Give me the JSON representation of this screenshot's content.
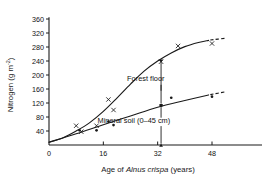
{
  "chart_data": {
    "type": "line",
    "title": "",
    "xlabel": "Age of Alnus crispa (years)",
    "xlabel_parts": {
      "prefix": "Age of ",
      "italic": "Alnus crispa",
      "suffix": " (years)"
    },
    "ylabel": "Nitrogen (g m-2)",
    "ylabel_parts": {
      "main": "Nitrogen (g  m",
      "superscript": "-2",
      "tail": ")"
    },
    "xlim": [
      0,
      52
    ],
    "ylim": [
      0,
      370
    ],
    "xticks": [
      0,
      16,
      32,
      48
    ],
    "xtick_labels": [
      "0",
      "16",
      "32",
      "48"
    ],
    "yticks": [
      40,
      80,
      120,
      160,
      200,
      240,
      280,
      320,
      360
    ],
    "ytick_labels": [
      "40",
      "80",
      "120",
      "160",
      "200",
      "240",
      "280",
      "320",
      "360"
    ],
    "grid": false,
    "legend": "none",
    "series": [
      {
        "name": "Forest floor",
        "marker": "x",
        "label": "Forest floor",
        "points": [
          {
            "x": 8.0,
            "y": 55
          },
          {
            "x": 9.5,
            "y": 38
          },
          {
            "x": 14.0,
            "y": 55
          },
          {
            "x": 17.5,
            "y": 130
          },
          {
            "x": 19.0,
            "y": 100
          },
          {
            "x": 33.0,
            "y": 238
          },
          {
            "x": 38.0,
            "y": 283
          },
          {
            "x": 48.0,
            "y": 290
          }
        ],
        "fit_curve": [
          {
            "x": 0,
            "y": 8
          },
          {
            "x": 4,
            "y": 20
          },
          {
            "x": 8,
            "y": 40
          },
          {
            "x": 12,
            "y": 64
          },
          {
            "x": 16,
            "y": 96
          },
          {
            "x": 20,
            "y": 134
          },
          {
            "x": 24,
            "y": 174
          },
          {
            "x": 28,
            "y": 211
          },
          {
            "x": 32,
            "y": 240
          },
          {
            "x": 36,
            "y": 263
          },
          {
            "x": 40,
            "y": 281
          },
          {
            "x": 44,
            "y": 293
          },
          {
            "x": 47,
            "y": 299
          }
        ],
        "dashed_extension": [
          {
            "x": 47.5,
            "y": 300
          },
          {
            "x": 52,
            "y": 305
          }
        ]
      },
      {
        "name": "Mineral soil (0-45 cm)",
        "marker": "dot",
        "label": "Mineral soil (0–45 cm)",
        "points": [
          {
            "x": 9.0,
            "y": 42
          },
          {
            "x": 14.0,
            "y": 42
          },
          {
            "x": 17.5,
            "y": 67
          },
          {
            "x": 19.0,
            "y": 57
          },
          {
            "x": 33.0,
            "y": 113
          },
          {
            "x": 36.0,
            "y": 135
          },
          {
            "x": 48.0,
            "y": 138
          }
        ],
        "fit_curve": [
          {
            "x": 0,
            "y": 8
          },
          {
            "x": 8,
            "y": 32
          },
          {
            "x": 16,
            "y": 58
          },
          {
            "x": 24,
            "y": 83
          },
          {
            "x": 32,
            "y": 108
          },
          {
            "x": 40,
            "y": 127
          },
          {
            "x": 47,
            "y": 143
          }
        ],
        "dashed_extension": [
          {
            "x": 47.5,
            "y": 144
          },
          {
            "x": 52,
            "y": 152
          }
        ]
      }
    ],
    "annotations": [
      {
        "text": "Forest floor",
        "label_x": 28.5,
        "label_y": 183,
        "arrow_from_x": 33.0,
        "arrow_from_y": 155,
        "arrow_to_x": 33.0,
        "arrow_to_y": 235,
        "arrow_down_from_x": 33.0,
        "arrow_down_from_y": 172,
        "arrow_down_to_x": 33.0,
        "arrow_down_to_y": 120
      },
      {
        "text": "Mineral soil (0–45 cm)",
        "label_x": 25.0,
        "label_y": 62,
        "arrow_from_x": 33.0,
        "arrow_from_y": 78,
        "arrow_to_x": 33.0,
        "arrow_to_y": 108,
        "arrow_down_from_x": 33.0,
        "arrow_down_from_y": 54,
        "arrow_down_to_x": 33.0,
        "arrow_down_to_y": 4
      }
    ],
    "colors": {
      "axis": "#1a1a1a",
      "curve": "#1a1a1a",
      "marker": "#1a1a1a",
      "background": "#ffffff"
    }
  }
}
